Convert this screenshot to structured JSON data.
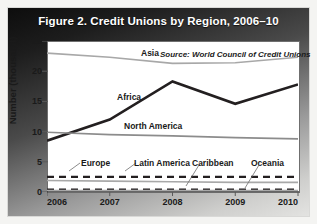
{
  "figure": {
    "title": "Figure 2. Credit Unions by Region, 2006–10",
    "source_note": "Source: World Council of Credit Unions"
  },
  "axes": {
    "ylabel": "Number (thousand)",
    "yticks": [
      "0",
      "5",
      "10",
      "15",
      "20",
      "25"
    ],
    "xticks": [
      "2006",
      "2007",
      "2008",
      "2009",
      "2010"
    ]
  },
  "labels": {
    "asia": "Asia",
    "africa": "Africa",
    "north_america": "North America",
    "europe": "Europe",
    "latin_america": "Latin America",
    "caribbean": "Caribbean",
    "oceania": "Oceania"
  },
  "colors": {
    "africa": "#231f20",
    "asia": "#a8a8a8",
    "north_america": "#8c8c8c",
    "europe": "#231f20",
    "latin_america": "#a8a8a8",
    "caribbean": "#231f20",
    "oceania": "#a8a8a8",
    "axis": "#5a5a5a",
    "title_text": "#ffffff"
  },
  "chart_data": {
    "type": "line",
    "title": "Figure 2. Credit Unions by Region, 2006–10",
    "xlabel": "",
    "ylabel": "Number (thousand)",
    "x": [
      2006,
      2007,
      2008,
      2009,
      2010
    ],
    "xlim": [
      2006,
      2010
    ],
    "ylim": [
      0,
      25
    ],
    "yticks": [
      0,
      5,
      10,
      15,
      20,
      25
    ],
    "grid": false,
    "legend": "inline-labels",
    "annotations": [
      "Source: World Council of Credit Unions"
    ],
    "series": [
      {
        "name": "Asia",
        "values": [
          23.0,
          22.3,
          21.3,
          21.4,
          22.3
        ],
        "style": "solid",
        "color": "#a8a8a8",
        "width": 1.6
      },
      {
        "name": "Africa",
        "values": [
          8.5,
          12.0,
          18.3,
          14.6,
          17.8
        ],
        "style": "solid",
        "color": "#231f20",
        "width": 2.6
      },
      {
        "name": "North America",
        "values": [
          9.9,
          9.5,
          9.3,
          9.0,
          8.8
        ],
        "style": "solid",
        "color": "#8c8c8c",
        "width": 1.6
      },
      {
        "name": "Europe",
        "values": [
          2.5,
          2.5,
          2.5,
          2.5,
          2.5
        ],
        "style": "dashed",
        "color": "#231f20",
        "width": 2.4
      },
      {
        "name": "Latin America",
        "values": [
          1.9,
          1.8,
          1.7,
          1.6,
          1.6
        ],
        "style": "solid",
        "color": "#a8a8a8",
        "width": 1.6
      },
      {
        "name": "Caribbean",
        "values": [
          0.4,
          0.4,
          0.4,
          0.4,
          0.4
        ],
        "style": "dashed",
        "color": "#231f20",
        "width": 2.0
      },
      {
        "name": "Oceania",
        "values": [
          0.25,
          0.25,
          0.25,
          0.25,
          0.25
        ],
        "style": "solid",
        "color": "#a8a8a8",
        "width": 1.6
      }
    ]
  }
}
